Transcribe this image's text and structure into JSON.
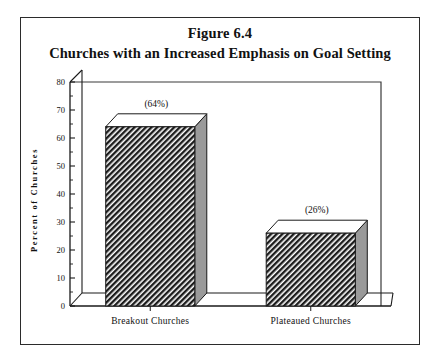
{
  "figure": {
    "number": "Figure 6.4",
    "title": "Churches with an Increased Emphasis on Goal Setting"
  },
  "axes": {
    "ylabel": "Percent of Churches",
    "y_ticks": [
      "0",
      "10",
      "20",
      "30",
      "40",
      "50",
      "60",
      "70",
      "80"
    ]
  },
  "chart_data": {
    "type": "bar",
    "title": "Churches with an Increased Emphasis on Goal Setting",
    "subtitle": "Figure 6.4",
    "categories": [
      "Breakout Churches",
      "Plateaued Churches"
    ],
    "values": [
      64,
      26
    ],
    "data_labels": [
      "(64%)",
      "(26%)"
    ],
    "xlabel": "",
    "ylabel": "Percent of Churches",
    "ylim": [
      0,
      80
    ],
    "ytick_step": 10,
    "yminor_step": 5,
    "grid": false,
    "legend": false,
    "style": "3d-hatched-bar",
    "colors": {
      "bar_face": "#222222",
      "bar_side": "#9a9a9a",
      "bar_top": "#ffffff",
      "axis": "#1a1a1a",
      "frame": "#2b2b2b",
      "background": "#ffffff"
    }
  }
}
